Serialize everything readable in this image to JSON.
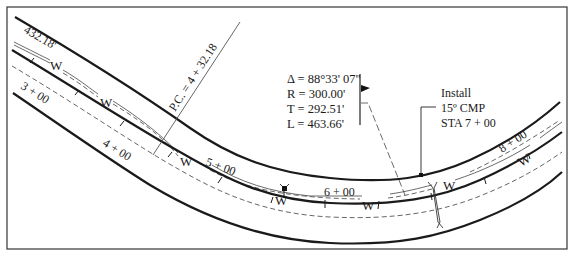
{
  "diagram": {
    "type": "highway plan view - horizontal curve",
    "stations": [
      "3 + 00",
      "4 + 00",
      "5 + 00",
      "6 + 00",
      "8 + 00"
    ],
    "distance_label": "432.18'",
    "pc_label": "P.C. = 4 + 32.18",
    "water_line_label": "W",
    "curve_data": {
      "delta": "Δ = 88°33' 07\"",
      "radius": "R = 300.00'",
      "tangent": "T = 292.51'",
      "length": "L = 463.66'"
    },
    "callout": {
      "line1": "Install",
      "line2": "15º CMP",
      "line3": "STA 7 + 00"
    }
  }
}
